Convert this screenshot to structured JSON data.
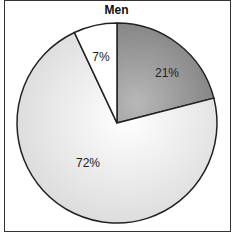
{
  "chart_data": {
    "type": "pie",
    "title": "Men",
    "categories": [
      "Segment A",
      "Segment B",
      "Segment C"
    ],
    "values": [
      21,
      72,
      7
    ],
    "labels": [
      "21%",
      "72%",
      "7%"
    ],
    "colors": [
      "#8a8a8a",
      "#e6e6e6",
      "#ffffff"
    ],
    "start_angle_deg": 0,
    "direction": "clockwise",
    "legend": "none"
  },
  "labels": {
    "a": "21%",
    "b": "72%",
    "c": "7%"
  }
}
